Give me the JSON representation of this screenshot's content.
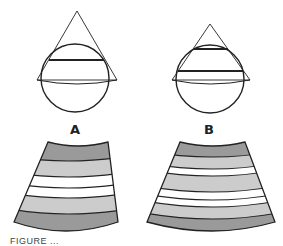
{
  "figure": {
    "panels": [
      {
        "id": "A",
        "label": "A",
        "description": "Triangle (cone cross-section) intersecting sphere with one focal plane chord",
        "band_sequence": [
          "dark",
          "medium",
          "white",
          "white",
          "medium",
          "dark"
        ]
      },
      {
        "id": "B",
        "label": "B",
        "description": "Smaller triangle intersecting sphere with two focal plane chords",
        "band_sequence": [
          "dark",
          "medium",
          "white",
          "medium",
          "white",
          "white",
          "medium",
          "dark"
        ]
      }
    ],
    "caption": "FIGURE ..."
  },
  "colors": {
    "outline": "#222222",
    "band_dark": "#9a9a9a",
    "band_medium": "#cccccc",
    "band_white": "#ffffff"
  }
}
